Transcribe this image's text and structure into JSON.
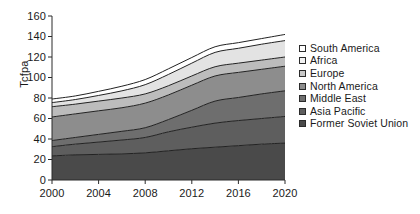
{
  "chart_data": {
    "type": "area",
    "stacked": true,
    "title": "",
    "subtitle": "",
    "xlabel": "",
    "ylabel": "Tcfpa",
    "xlim": [
      2000,
      2020
    ],
    "ylim": [
      0,
      160
    ],
    "grid": false,
    "legend_position": "right",
    "x": [
      2000,
      2002,
      2004,
      2006,
      2008,
      2010,
      2012,
      2014,
      2016,
      2018,
      2020
    ],
    "x_tick_labels": [
      "2000",
      "2004",
      "2008",
      "2012",
      "2016",
      "2020"
    ],
    "x_ticks": [
      2000,
      2004,
      2008,
      2012,
      2016,
      2020
    ],
    "y_tick_labels": [
      "0",
      "20",
      "40",
      "60",
      "80",
      "100",
      "120",
      "140",
      "160"
    ],
    "y_ticks": [
      0,
      20,
      40,
      60,
      80,
      100,
      120,
      140,
      160
    ],
    "stack_order_bottom_to_top": [
      "Former Soviet Union",
      "Asia Pacific",
      "Middle East",
      "North America",
      "Europe",
      "Africa",
      "South America"
    ],
    "series": [
      {
        "name": "Former Soviet Union",
        "color": "#4a4a4a",
        "values": [
          23.5,
          24.5,
          25.0,
          25.5,
          26.5,
          28.5,
          30.5,
          32.0,
          33.5,
          35.0,
          36.0
        ]
      },
      {
        "name": "Asia Pacific",
        "color": "#5e5e5e",
        "values": [
          9.0,
          10.5,
          12.0,
          13.5,
          15.0,
          18.5,
          21.0,
          23.5,
          24.5,
          25.0,
          26.0
        ]
      },
      {
        "name": "Middle East",
        "color": "#6e6e6e",
        "values": [
          6.0,
          6.5,
          7.5,
          8.5,
          9.5,
          12.0,
          16.5,
          21.5,
          22.5,
          24.0,
          25.0
        ]
      },
      {
        "name": "North America",
        "color": "#8d8d8d",
        "values": [
          23.0,
          23.0,
          23.0,
          23.0,
          24.0,
          24.0,
          24.5,
          24.5,
          24.5,
          24.0,
          24.0
        ]
      },
      {
        "name": "Europe",
        "color": "#bcbcbc",
        "values": [
          10.0,
          9.5,
          9.5,
          9.5,
          9.0,
          9.0,
          9.0,
          9.0,
          9.0,
          9.0,
          9.0
        ]
      },
      {
        "name": "Africa",
        "color": "#e3e3e3",
        "values": [
          4.0,
          4.5,
          5.5,
          7.0,
          9.0,
          11.0,
          12.5,
          14.0,
          14.5,
          15.5,
          16.0
        ]
      },
      {
        "name": "South America",
        "color": "#ffffff",
        "values": [
          3.5,
          3.5,
          4.0,
          4.5,
          5.0,
          5.5,
          5.5,
          5.5,
          5.5,
          5.5,
          6.0
        ]
      }
    ],
    "cumulative_totals": [
      79.0,
      82.0,
      86.5,
      91.5,
      98.0,
      108.5,
      119.5,
      130.0,
      134.0,
      138.0,
      142.0
    ],
    "legend_entries_top_to_bottom": [
      {
        "label": "South America",
        "color": "#ffffff"
      },
      {
        "label": "Africa",
        "color": "#f2f2f2"
      },
      {
        "label": "Europe",
        "color": "#c9c9c9"
      },
      {
        "label": "North America",
        "color": "#8d8d8d"
      },
      {
        "label": "Middle East",
        "color": "#6e6e6e"
      },
      {
        "label": "Asia Pacific",
        "color": "#5e5e5e"
      },
      {
        "label": "Former Soviet Union",
        "color": "#4a4a4a"
      }
    ]
  },
  "axis": {
    "y_title": "Tcfpa",
    "line_color": "#2b2b2b"
  }
}
